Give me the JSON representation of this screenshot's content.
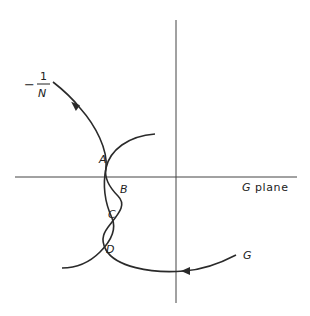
{
  "diagram": {
    "plane_label": "G plane",
    "plane_symbol": "G",
    "plane_word": "plane",
    "curve_labels": {
      "describing_function": {
        "minus": "−",
        "numerator": "1",
        "denominator": "N"
      },
      "nyquist": "G"
    },
    "intersection_points": [
      "A",
      "B",
      "C",
      "D"
    ],
    "colors": {
      "curve": "#2a2a2a",
      "axis": "#444444",
      "background": "#ffffff"
    }
  }
}
